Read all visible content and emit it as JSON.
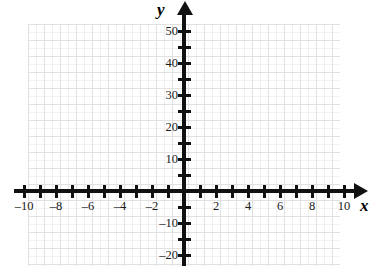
{
  "chart_data": {
    "type": "scatter",
    "title": "",
    "subtitle": "",
    "xlabel": "x",
    "ylabel": "y",
    "xlim": [
      -10.6,
      10.6
    ],
    "ylim": [
      -23,
      54
    ],
    "grid": true,
    "legend": null,
    "series": [],
    "x_tick_step": 1,
    "x_label_step": 2,
    "y_tick_step": 5,
    "y_label_step": 10,
    "x_tick_values": [
      -10,
      -9,
      -8,
      -7,
      -6,
      -5,
      -4,
      -3,
      -2,
      -1,
      1,
      2,
      3,
      4,
      5,
      6,
      7,
      8,
      9,
      10
    ],
    "y_tick_values": [
      -20,
      -15,
      -10,
      -5,
      5,
      10,
      15,
      20,
      25,
      30,
      35,
      40,
      45,
      50
    ],
    "x_tick_labels": [
      {
        "value": -10,
        "text": "–10"
      },
      {
        "value": -8,
        "text": "–8"
      },
      {
        "value": -6,
        "text": "–6"
      },
      {
        "value": -4,
        "text": "–4"
      },
      {
        "value": -2,
        "text": "–2"
      },
      {
        "value": 2,
        "text": "2"
      },
      {
        "value": 4,
        "text": "4"
      },
      {
        "value": 6,
        "text": "6"
      },
      {
        "value": 8,
        "text": "8"
      },
      {
        "value": 10,
        "text": "10"
      }
    ],
    "y_tick_labels": [
      {
        "value": 50,
        "text": "50"
      },
      {
        "value": 40,
        "text": "40"
      },
      {
        "value": 30,
        "text": "30"
      },
      {
        "value": 20,
        "text": "20"
      },
      {
        "value": 10,
        "text": "10"
      },
      {
        "value": -10,
        "text": "–10"
      },
      {
        "value": -20,
        "text": "–20"
      }
    ],
    "axis_names": {
      "x": "x",
      "y": "y"
    },
    "colors": {
      "axis": "#111111",
      "grid_major": "#dcdcdc",
      "grid_minor": "#f0f0f0",
      "label_text": "#1a1a1a",
      "background": "#ffffff"
    },
    "geometry": {
      "origin_x": 184,
      "origin_y": 191,
      "px_per_x_unit": 16,
      "px_per_y_tick": 16,
      "y_units_per_tick": 5
    }
  }
}
